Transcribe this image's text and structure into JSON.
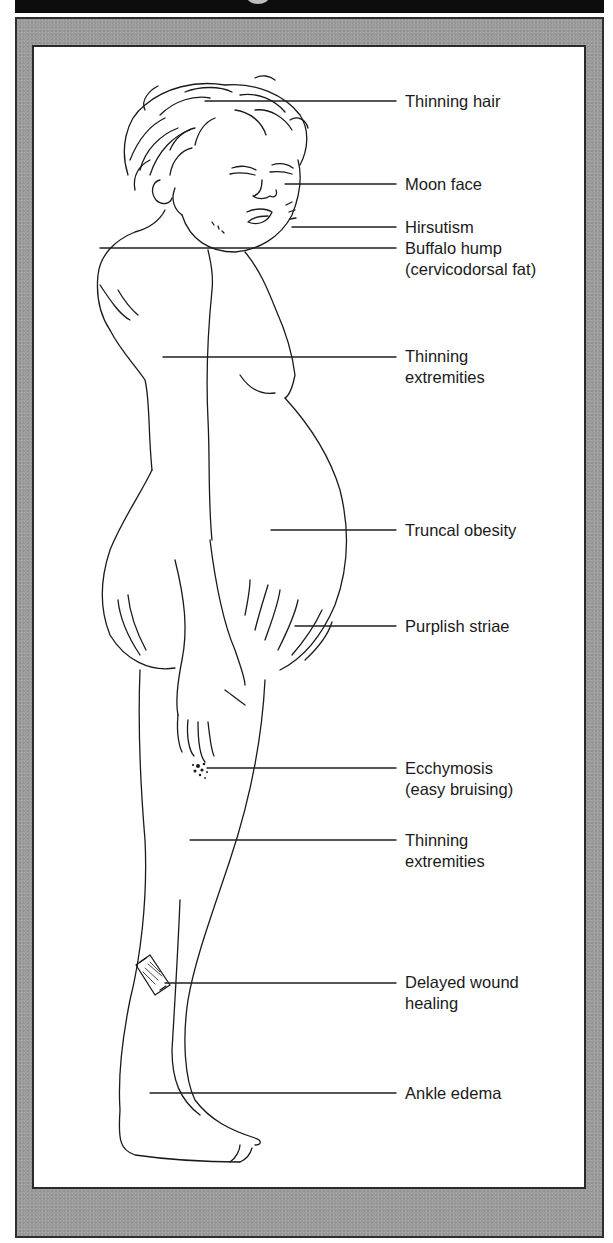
{
  "diagram": {
    "colors": {
      "title_band": "#0d0d0d",
      "frame": "#9c9c9c",
      "frame_border": "#2e2e2e",
      "panel": "#ffffff",
      "ink": "#1a1a1a"
    },
    "labels": [
      {
        "id": "thinning-hair",
        "lines": [
          "Thinning hair"
        ],
        "y": 173,
        "line_y": 101,
        "line_x1": 205,
        "line_x2": 396
      },
      {
        "id": "moon-face",
        "lines": [
          "Moon face"
        ],
        "y": 174,
        "line_y": 184,
        "line_x1": 285,
        "line_x2": 396
      },
      {
        "id": "hirsutism",
        "lines": [
          "Hirsutism"
        ],
        "y": 217,
        "line_y": 227,
        "line_x1": 292,
        "line_x2": 396
      },
      {
        "id": "buffalo-hump",
        "lines": [
          "Buffalo hump",
          "(cervicodorsal fat)"
        ],
        "y": 238,
        "line_y": 248,
        "line_x1": 100,
        "line_x2": 396
      },
      {
        "id": "thinning-extremities-upper",
        "lines": [
          "Thinning",
          "extremities"
        ],
        "y": 346,
        "line_y": 357,
        "line_x1": 163,
        "line_x2": 396
      },
      {
        "id": "truncal-obesity",
        "lines": [
          "Truncal obesity"
        ],
        "y": 520,
        "line_y": 530,
        "line_x1": 271,
        "line_x2": 396
      },
      {
        "id": "purplish-striae",
        "lines": [
          "Purplish striae"
        ],
        "y": 616,
        "line_y": 626,
        "line_x1": 295,
        "line_x2": 396
      },
      {
        "id": "ecchymosis",
        "lines": [
          "Ecchymosis",
          "(easy bruising)"
        ],
        "y": 758,
        "line_y": 768,
        "line_x1": 207,
        "line_x2": 396
      },
      {
        "id": "thinning-extremities-lower",
        "lines": [
          "Thinning",
          "extremities"
        ],
        "y": 830,
        "line_y": 840,
        "line_x1": 190,
        "line_x2": 396
      },
      {
        "id": "delayed-wound-healing",
        "lines": [
          "Delayed wound",
          "healing"
        ],
        "y": 972,
        "line_y": 983,
        "line_x1": 165,
        "line_x2": 396
      },
      {
        "id": "ankle-edema",
        "lines": [
          "Ankle edema"
        ],
        "y": 1083,
        "line_y": 1093,
        "line_x1": 150,
        "line_x2": 396
      }
    ]
  }
}
